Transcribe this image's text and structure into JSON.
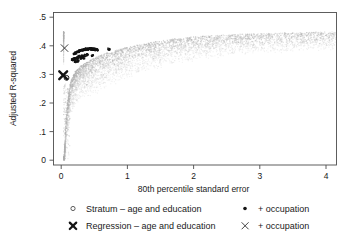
{
  "chart_data": {
    "type": "scatter",
    "title": "",
    "xlabel": "80th percentile standard error",
    "ylabel": "Adjusted R-squared",
    "xlim": [
      -0.12,
      4.25
    ],
    "ylim": [
      -0.012,
      0.52
    ],
    "xticks": [
      0,
      1,
      2,
      3,
      4
    ],
    "xticklabels": [
      "0",
      "1",
      "2",
      "3",
      "4"
    ],
    "yticks": [
      0,
      0.1,
      0.2,
      0.3,
      0.4,
      0.5
    ],
    "yticklabels": [
      "0",
      ".1",
      ".2",
      ".3",
      ".4",
      ".5"
    ],
    "grid": false,
    "legend_position": "below",
    "series": [
      {
        "name": "Stratum - age and education",
        "marker": "open-circle",
        "color": "#b0b0b0",
        "note": "large gray cloud of stratum estimates, concave-increasing envelope",
        "points": [
          [
            0.04,
            0.005
          ],
          [
            0.05,
            0.02
          ],
          [
            0.05,
            0.045
          ],
          [
            0.06,
            0.07
          ],
          [
            0.06,
            0.1
          ],
          [
            0.07,
            0.125
          ],
          [
            0.07,
            0.145
          ],
          [
            0.08,
            0.16
          ],
          [
            0.08,
            0.175
          ],
          [
            0.09,
            0.185
          ],
          [
            0.09,
            0.2
          ],
          [
            0.1,
            0.205
          ],
          [
            0.1,
            0.215
          ],
          [
            0.11,
            0.225
          ],
          [
            0.11,
            0.235
          ],
          [
            0.12,
            0.24
          ],
          [
            0.12,
            0.25
          ],
          [
            0.13,
            0.255
          ],
          [
            0.13,
            0.265
          ],
          [
            0.14,
            0.27
          ],
          [
            0.15,
            0.275
          ],
          [
            0.15,
            0.28
          ],
          [
            0.16,
            0.285
          ],
          [
            0.17,
            0.29
          ],
          [
            0.18,
            0.295
          ],
          [
            0.19,
            0.3
          ],
          [
            0.2,
            0.305
          ],
          [
            0.21,
            0.31
          ],
          [
            0.22,
            0.312
          ],
          [
            0.23,
            0.315
          ],
          [
            0.25,
            0.32
          ],
          [
            0.27,
            0.325
          ],
          [
            0.29,
            0.328
          ],
          [
            0.31,
            0.332
          ],
          [
            0.33,
            0.335
          ],
          [
            0.36,
            0.34
          ],
          [
            0.39,
            0.344
          ],
          [
            0.42,
            0.348
          ],
          [
            0.45,
            0.352
          ],
          [
            0.48,
            0.356
          ],
          [
            0.52,
            0.36
          ],
          [
            0.56,
            0.364
          ],
          [
            0.6,
            0.368
          ],
          [
            0.65,
            0.372
          ],
          [
            0.7,
            0.376
          ],
          [
            0.76,
            0.38
          ],
          [
            0.82,
            0.384
          ],
          [
            0.88,
            0.388
          ],
          [
            0.95,
            0.392
          ],
          [
            1.02,
            0.396
          ],
          [
            1.1,
            0.4
          ],
          [
            1.18,
            0.404
          ],
          [
            1.27,
            0.408
          ],
          [
            1.36,
            0.412
          ],
          [
            1.46,
            0.416
          ],
          [
            1.56,
            0.42
          ],
          [
            1.67,
            0.423
          ],
          [
            1.78,
            0.426
          ],
          [
            1.9,
            0.429
          ],
          [
            2.02,
            0.432
          ],
          [
            2.15,
            0.434
          ],
          [
            2.28,
            0.436
          ],
          [
            2.42,
            0.438
          ],
          [
            2.56,
            0.44
          ],
          [
            2.71,
            0.441
          ],
          [
            2.86,
            0.442
          ],
          [
            3.02,
            0.443
          ],
          [
            3.18,
            0.444
          ],
          [
            3.35,
            0.445
          ],
          [
            3.52,
            0.446
          ],
          [
            3.7,
            0.447
          ],
          [
            3.88,
            0.448
          ],
          [
            4.06,
            0.449
          ]
        ]
      },
      {
        "name": "Stratum - age and education + occupation",
        "marker": "filled-dot",
        "color": "#141414",
        "note": "dense black cluster, high R-squared at small standard error",
        "points": [
          [
            0.17,
            0.352
          ],
          [
            0.19,
            0.353
          ],
          [
            0.21,
            0.355
          ],
          [
            0.23,
            0.356
          ],
          [
            0.25,
            0.358
          ],
          [
            0.2,
            0.372
          ],
          [
            0.22,
            0.375
          ],
          [
            0.24,
            0.378
          ],
          [
            0.26,
            0.38
          ],
          [
            0.28,
            0.382
          ],
          [
            0.3,
            0.384
          ],
          [
            0.32,
            0.385
          ],
          [
            0.34,
            0.386
          ],
          [
            0.36,
            0.387
          ],
          [
            0.38,
            0.388
          ],
          [
            0.4,
            0.388
          ],
          [
            0.42,
            0.389
          ],
          [
            0.44,
            0.389
          ],
          [
            0.46,
            0.389
          ],
          [
            0.48,
            0.388
          ],
          [
            0.5,
            0.388
          ],
          [
            0.52,
            0.387
          ],
          [
            0.54,
            0.386
          ],
          [
            0.27,
            0.362
          ],
          [
            0.31,
            0.364
          ],
          [
            0.35,
            0.366
          ],
          [
            0.39,
            0.368
          ],
          [
            0.3,
            0.356
          ],
          [
            0.34,
            0.358
          ],
          [
            0.72,
            0.388
          ],
          [
            0.47,
            0.366
          ],
          [
            0.21,
            0.345
          ],
          [
            0.25,
            0.347
          ]
        ]
      },
      {
        "name": "Regression - age and education",
        "marker": "bold-x",
        "color": "#141414",
        "points": [
          [
            0.03,
            0.297
          ]
        ]
      },
      {
        "name": "Regression - age and education + occupation",
        "marker": "thin-x",
        "color": "#3a3a3a",
        "points": [
          [
            0.05,
            0.392
          ]
        ]
      },
      {
        "name": "Stratum reference point",
        "marker": "open-circle-dark",
        "color": "#1a1a1a",
        "points": [
          [
            0.08,
            0.288
          ]
        ]
      }
    ]
  },
  "axes": {
    "xlabel": "80th percentile standard error",
    "ylabel": "Adjusted R-squared",
    "xticklabels": [
      "0",
      "1",
      "2",
      "3",
      "4"
    ],
    "yticklabels": [
      "0",
      ".1",
      ".2",
      ".3",
      ".4",
      ".5"
    ]
  },
  "legend": {
    "entries": [
      {
        "marker": "open-circle",
        "label": "Stratum – age and education",
        "column": "left",
        "row": 1
      },
      {
        "marker": "filled-dot",
        "label": "+ occupation",
        "column": "right",
        "row": 1
      },
      {
        "marker": "bold-x",
        "label": "Regression – age and education",
        "column": "left",
        "row": 2
      },
      {
        "marker": "thin-x",
        "label": "+ occupation",
        "column": "right",
        "row": 2
      }
    ]
  },
  "colors": {
    "cloud": "#b0b0b0",
    "highlight": "#141414",
    "frame": "#4d4d4d",
    "text": "#1a1a1a",
    "background": "#ffffff"
  }
}
